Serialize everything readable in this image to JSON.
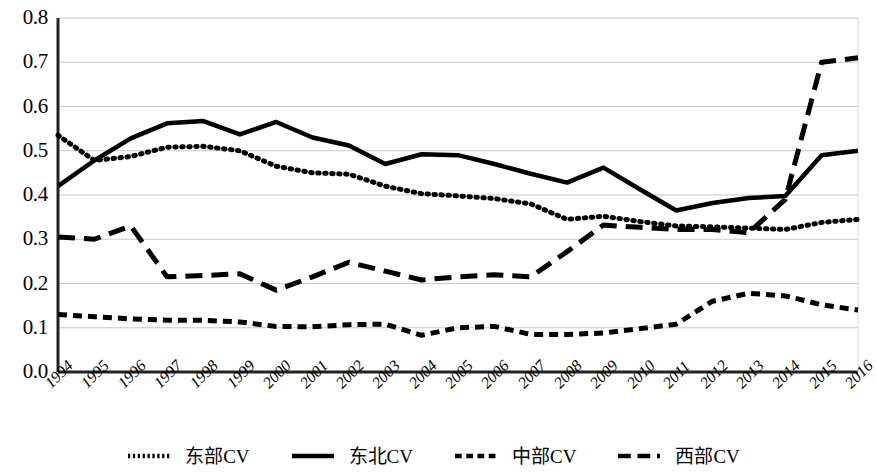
{
  "chart_data": {
    "type": "line",
    "title": "",
    "subtitle": "",
    "xlabel": "",
    "ylabel": "",
    "xlim": [
      1994,
      2016
    ],
    "ylim": [
      0.0,
      0.8
    ],
    "grid": true,
    "legend_position": "bottom",
    "y_ticks": [
      "0.0",
      "0.1",
      "0.2",
      "0.3",
      "0.4",
      "0.5",
      "0.6",
      "0.7",
      "0.8"
    ],
    "y_tick_values": [
      0.0,
      0.1,
      0.2,
      0.3,
      0.4,
      0.5,
      0.6,
      0.7,
      0.8
    ],
    "categories": [
      "1994",
      "1995",
      "1996",
      "1997",
      "1998",
      "1999",
      "2000",
      "2001",
      "2002",
      "2003",
      "2004",
      "2005",
      "2006",
      "2007",
      "2008",
      "2009",
      "2010",
      "2011",
      "2012",
      "2013",
      "2014",
      "2015",
      "2016"
    ],
    "x": [
      1994,
      1995,
      1996,
      1997,
      1998,
      1999,
      2000,
      2001,
      2002,
      2003,
      2004,
      2005,
      2006,
      2007,
      2008,
      2009,
      2010,
      2011,
      2012,
      2013,
      2014,
      2015,
      2016
    ],
    "series": [
      {
        "name": "东部CV",
        "style": "dotted",
        "color": "#000000",
        "values": [
          0.535,
          0.478,
          0.487,
          0.508,
          0.51,
          0.5,
          0.465,
          0.45,
          0.447,
          0.42,
          0.403,
          0.398,
          0.392,
          0.38,
          0.345,
          0.352,
          0.34,
          0.33,
          0.328,
          0.325,
          0.322,
          0.338,
          0.345
        ]
      },
      {
        "name": "东北CV",
        "style": "solid",
        "color": "#000000",
        "values": [
          0.42,
          0.478,
          0.528,
          0.562,
          0.567,
          0.537,
          0.565,
          0.53,
          0.512,
          0.47,
          0.492,
          0.49,
          0.47,
          0.448,
          0.428,
          0.462,
          0.413,
          0.365,
          0.382,
          0.393,
          0.398,
          0.49,
          0.5
        ]
      },
      {
        "name": "中部CV",
        "style": "short-dash",
        "color": "#000000",
        "values": [
          0.13,
          0.125,
          0.12,
          0.117,
          0.117,
          0.113,
          0.103,
          0.102,
          0.107,
          0.108,
          0.083,
          0.1,
          0.103,
          0.085,
          0.085,
          0.088,
          0.098,
          0.108,
          0.16,
          0.178,
          0.172,
          0.152,
          0.14
        ]
      },
      {
        "name": "西部CV",
        "style": "long-dash",
        "color": "#000000",
        "values": [
          0.305,
          0.3,
          0.33,
          0.215,
          0.218,
          0.222,
          0.185,
          0.215,
          0.248,
          0.228,
          0.208,
          0.215,
          0.22,
          0.215,
          0.272,
          0.332,
          0.327,
          0.322,
          0.322,
          0.315,
          0.39,
          0.7,
          0.71
        ]
      }
    ]
  },
  "legend": {
    "items": [
      {
        "label": "东部CV",
        "style": "dotted"
      },
      {
        "label": "东北CV",
        "style": "solid"
      },
      {
        "label": "中部CV",
        "style": "short-dash"
      },
      {
        "label": "西部CV",
        "style": "long-dash"
      }
    ]
  }
}
